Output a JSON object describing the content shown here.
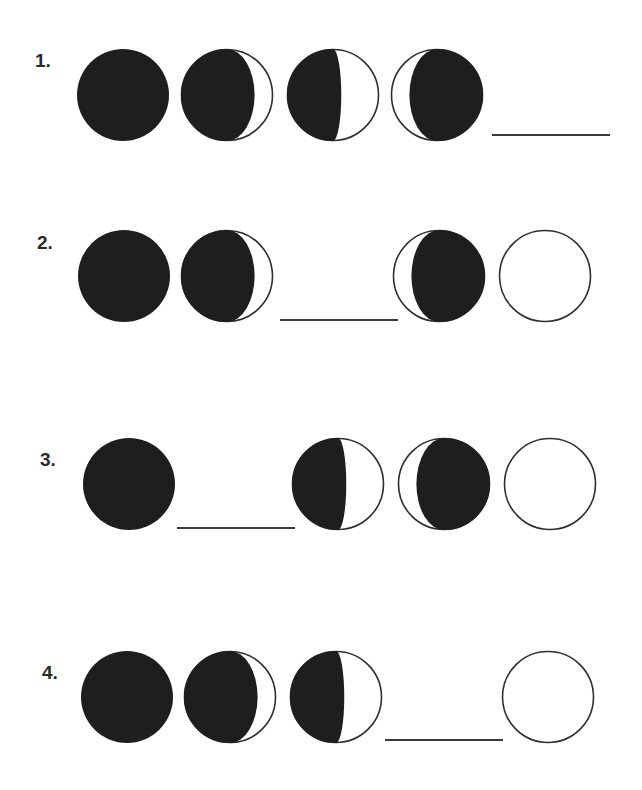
{
  "colors": {
    "dark": "#1e1e1e",
    "outline": "#2e2e2e",
    "line": "#3a3a3a",
    "background": "#ffffff"
  },
  "radius": 46,
  "rows": [
    {
      "label": "1.",
      "label_pos": [
        35,
        50
      ],
      "cy": 95,
      "items": [
        {
          "kind": "moon",
          "phase": "new-moon",
          "cx": 123
        },
        {
          "kind": "moon",
          "phase": "waxing-crescent",
          "cx": 227
        },
        {
          "kind": "moon",
          "phase": "first-quarter",
          "cx": 333
        },
        {
          "kind": "moon",
          "phase": "waning-crescent-left-lit",
          "cx": 437
        },
        {
          "kind": "blank",
          "x1": 492,
          "x2": 610,
          "y": 135
        }
      ]
    },
    {
      "label": "2.",
      "label_pos": [
        37,
        232
      ],
      "cy": 276,
      "items": [
        {
          "kind": "moon",
          "phase": "new-moon",
          "cx": 124
        },
        {
          "kind": "moon",
          "phase": "waxing-crescent",
          "cx": 227
        },
        {
          "kind": "blank",
          "x1": 280,
          "x2": 398,
          "y": 320
        },
        {
          "kind": "moon",
          "phase": "waning-crescent-left-lit",
          "cx": 439
        },
        {
          "kind": "moon",
          "phase": "full-moon",
          "cx": 545
        }
      ]
    },
    {
      "label": "3.",
      "label_pos": [
        40,
        449
      ],
      "cy": 484,
      "items": [
        {
          "kind": "moon",
          "phase": "new-moon",
          "cx": 129
        },
        {
          "kind": "blank",
          "x1": 177,
          "x2": 295,
          "y": 528
        },
        {
          "kind": "moon",
          "phase": "first-quarter",
          "cx": 338
        },
        {
          "kind": "moon",
          "phase": "waning-crescent-left-lit",
          "cx": 444
        },
        {
          "kind": "moon",
          "phase": "full-moon",
          "cx": 550
        }
      ]
    },
    {
      "label": "4.",
      "label_pos": [
        42,
        662
      ],
      "cy": 697,
      "items": [
        {
          "kind": "moon",
          "phase": "new-moon",
          "cx": 127
        },
        {
          "kind": "moon",
          "phase": "waxing-crescent",
          "cx": 230
        },
        {
          "kind": "moon",
          "phase": "first-quarter",
          "cx": 336
        },
        {
          "kind": "blank",
          "x1": 385,
          "x2": 503,
          "y": 740
        },
        {
          "kind": "moon",
          "phase": "full-moon",
          "cx": 548
        }
      ]
    }
  ]
}
